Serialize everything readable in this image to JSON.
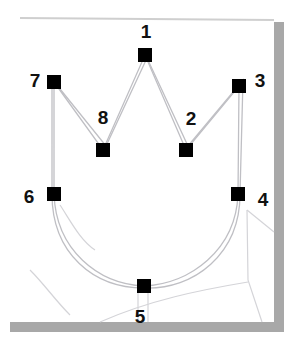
{
  "figure": {
    "colors": {
      "background": "#ffffff",
      "sketch_line": "#c8c8cc",
      "path_line": "#bdbdc2",
      "anchor": "#000000",
      "frame_shadow": "#9a9a9a",
      "frame_top": "#c9c9c9"
    },
    "anchors": [
      {
        "id": "1",
        "label": "1",
        "x": 145,
        "y": 55,
        "label_x": 146,
        "label_y": 31
      },
      {
        "id": "2",
        "label": "2",
        "x": 186,
        "y": 150,
        "label_x": 191,
        "label_y": 118
      },
      {
        "id": "3",
        "label": "3",
        "x": 239,
        "y": 86,
        "label_x": 260,
        "label_y": 80
      },
      {
        "id": "4",
        "label": "4",
        "x": 238,
        "y": 194,
        "label_x": 263,
        "label_y": 199
      },
      {
        "id": "5",
        "label": "5",
        "x": 144,
        "y": 286,
        "label_x": 140,
        "label_y": 316
      },
      {
        "id": "6",
        "label": "6",
        "x": 54,
        "y": 194,
        "label_x": 29,
        "label_y": 196
      },
      {
        "id": "7",
        "label": "7",
        "x": 54,
        "y": 82,
        "label_x": 35,
        "label_y": 80
      },
      {
        "id": "8",
        "label": "8",
        "x": 103,
        "y": 150,
        "label_x": 103,
        "label_y": 117
      }
    ]
  }
}
